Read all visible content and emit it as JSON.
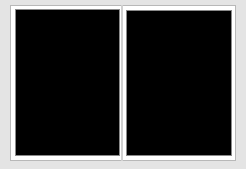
{
  "view": {
    "layout": "two-page-spread",
    "background_color": "#e4e4e4",
    "frame_color": "#ffffff",
    "panel_color": "#000000"
  },
  "panels": [
    {
      "name": "left-page",
      "content": ""
    },
    {
      "name": "right-page",
      "content": ""
    }
  ]
}
